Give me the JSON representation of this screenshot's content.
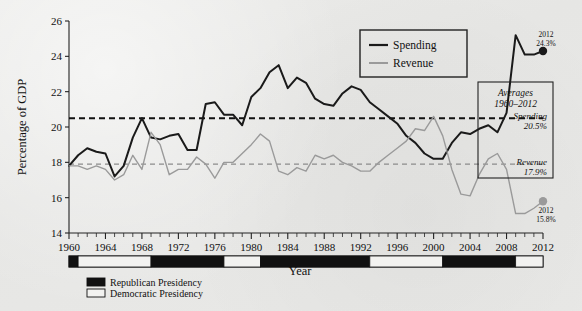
{
  "chart_data": {
    "type": "line",
    "title": "",
    "xlabel": "Year",
    "ylabel": "Percentage of GDP",
    "xlim": [
      1960,
      2012
    ],
    "ylim": [
      14,
      26
    ],
    "ytick_labels": [
      "14",
      "16",
      "18",
      "20",
      "22",
      "24",
      "26"
    ],
    "xtick_labels": [
      "1960",
      "1964",
      "1968",
      "1972",
      "1976",
      "1980",
      "1984",
      "1988",
      "1992",
      "1996",
      "2000",
      "2004",
      "2008",
      "2012"
    ],
    "grid": false,
    "legend_position": "top-right",
    "x": [
      1960,
      1961,
      1962,
      1963,
      1964,
      1965,
      1966,
      1967,
      1968,
      1969,
      1970,
      1971,
      1972,
      1973,
      1974,
      1975,
      1976,
      1977,
      1978,
      1979,
      1980,
      1981,
      1982,
      1983,
      1984,
      1985,
      1986,
      1987,
      1988,
      1989,
      1990,
      1991,
      1992,
      1993,
      1994,
      1995,
      1996,
      1997,
      1998,
      1999,
      2000,
      2001,
      2002,
      2003,
      2004,
      2005,
      2006,
      2007,
      2008,
      2009,
      2010,
      2011,
      2012
    ],
    "series": [
      {
        "name": "Spending",
        "color": "#1a1a1a",
        "values": [
          17.8,
          18.4,
          18.8,
          18.6,
          18.5,
          17.2,
          17.8,
          19.4,
          20.5,
          19.4,
          19.3,
          19.5,
          19.6,
          18.7,
          18.7,
          21.3,
          21.4,
          20.7,
          20.7,
          20.1,
          21.7,
          22.2,
          23.1,
          23.5,
          22.2,
          22.8,
          22.5,
          21.6,
          21.3,
          21.2,
          21.9,
          22.3,
          22.1,
          21.4,
          21.0,
          20.6,
          20.2,
          19.5,
          19.1,
          18.5,
          18.2,
          18.2,
          19.1,
          19.7,
          19.6,
          19.9,
          20.1,
          19.7,
          20.8,
          25.2,
          24.1,
          24.1,
          24.3
        ]
      },
      {
        "name": "Revenue",
        "color": "#9a9a9a",
        "values": [
          17.8,
          17.8,
          17.6,
          17.8,
          17.6,
          17.0,
          17.3,
          18.4,
          17.6,
          19.7,
          19.0,
          17.3,
          17.6,
          17.6,
          18.3,
          17.9,
          17.1,
          18.0,
          18.0,
          18.5,
          19.0,
          19.6,
          19.2,
          17.5,
          17.3,
          17.7,
          17.5,
          18.4,
          18.2,
          18.4,
          18.0,
          17.8,
          17.5,
          17.5,
          18.0,
          18.4,
          18.8,
          19.2,
          19.9,
          19.8,
          20.6,
          19.5,
          17.6,
          16.2,
          16.1,
          17.3,
          18.2,
          18.5,
          17.6,
          15.1,
          15.1,
          15.4,
          15.8
        ]
      }
    ],
    "average_lines": [
      {
        "name": "Spending",
        "label": "Spending",
        "value_label": "20.5%",
        "value": 20.5,
        "color": "#111111",
        "style": "dashed"
      },
      {
        "name": "Revenue",
        "label": "Revenue",
        "value_label": "17.9%",
        "value": 17.9,
        "color": "#8c8c8c",
        "style": "dashed"
      }
    ],
    "annotations": [
      {
        "name": "spending-2012",
        "year": "2012",
        "value_label": "24.3%",
        "value": 24.3,
        "color": "#1a1a1a"
      },
      {
        "name": "revenue-2012",
        "year": "2012",
        "value_label": "15.8%",
        "value": 15.8,
        "color": "#9a9a9a"
      }
    ],
    "presidency_bar": [
      {
        "party": "Republican",
        "start": 1960,
        "end": 1961
      },
      {
        "party": "Democratic",
        "start": 1961,
        "end": 1969
      },
      {
        "party": "Republican",
        "start": 1969,
        "end": 1977
      },
      {
        "party": "Democratic",
        "start": 1977,
        "end": 1981
      },
      {
        "party": "Republican",
        "start": 1981,
        "end": 1993
      },
      {
        "party": "Democratic",
        "start": 1993,
        "end": 2001
      },
      {
        "party": "Republican",
        "start": 2001,
        "end": 2009
      },
      {
        "party": "Democratic",
        "start": 2009,
        "end": 2012
      }
    ]
  },
  "legend": {
    "spending_label": "Spending",
    "revenue_label": "Revenue"
  },
  "averages_box": {
    "title_line1": "Averages",
    "title_line2": "1960–2012",
    "spending_label": "Spending",
    "spending_value": "20.5%",
    "revenue_label": "Revenue",
    "revenue_value": "17.9%"
  },
  "axis": {
    "y_title": "Percentage of GDP",
    "x_title": "Year"
  },
  "party_legend": {
    "republican_label": "Republican Presidency",
    "democratic_label": "Democratic Presidency"
  },
  "endpoints": {
    "spending_year": "2012",
    "spending_value": "24.3%",
    "revenue_year": "2012",
    "revenue_value": "15.8%"
  },
  "colors": {
    "spending": "#1a1a1a",
    "revenue": "#9a9a9a",
    "republican": "#111111",
    "democratic": "#f2f2f0",
    "background": "#e8e8e6"
  }
}
